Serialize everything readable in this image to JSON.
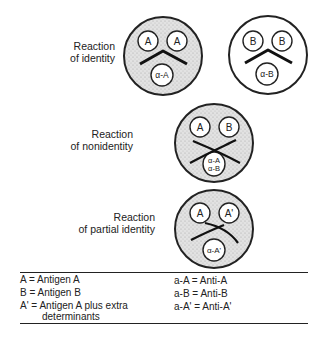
{
  "diagram": {
    "type": "double-immunodiffusion (Ouchterlony) reaction patterns",
    "reactions": [
      {
        "label_line1": "Reaction",
        "label_line2": "of identity",
        "plates": [
          {
            "well_left": "A",
            "well_right": "A",
            "well_bottom": "a-A",
            "precipitin": "fused arc",
            "shaded": true
          },
          {
            "well_left": "B",
            "well_right": "B",
            "well_bottom": "a-B",
            "precipitin": "fused arc",
            "shaded": false
          }
        ]
      },
      {
        "label_line1": "Reaction",
        "label_line2": "of nonidentity",
        "plates": [
          {
            "well_left": "A",
            "well_right": "B",
            "well_bottom_line1": "a-A",
            "well_bottom_line2": "a-B",
            "precipitin": "crossed lines",
            "shaded": true
          }
        ]
      },
      {
        "label_line1": "Reaction",
        "label_line2": "of partial identity",
        "plates": [
          {
            "well_left": "A",
            "well_right": "A'",
            "well_bottom": "a-A'",
            "precipitin": "spur",
            "shaded": true
          }
        ]
      }
    ]
  },
  "legend": {
    "left": [
      "A = Antigen A",
      "B = Antigen B",
      "A' = Antigen A plus extra",
      "determinants"
    ],
    "right": [
      "a-A = Anti-A",
      "a-B = Anti-B",
      "a-A' = Anti-A'"
    ]
  },
  "colors": {
    "ink": "#222222",
    "plate_fill": "#dcdcdc",
    "plate_fill_plain": "#ffffff",
    "well_fill": "#ffffff"
  }
}
